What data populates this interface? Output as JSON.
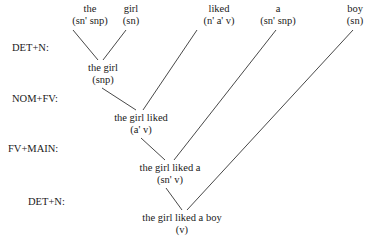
{
  "leaves": [
    {
      "word": "the",
      "category": "(sn' snp)",
      "x": 90,
      "y": 3
    },
    {
      "word": "girl",
      "category": "(sn)",
      "x": 131,
      "y": 3
    },
    {
      "word": "liked",
      "category": "(n' a' v)",
      "x": 219,
      "y": 3
    },
    {
      "word": "a",
      "category": "(sn' snp)",
      "x": 278,
      "y": 3
    },
    {
      "word": "boy",
      "category": "(sn)",
      "x": 355,
      "y": 3
    }
  ],
  "nodes": [
    {
      "phrase": "the girl",
      "category": "(snp)",
      "x": 103,
      "y": 62
    },
    {
      "phrase": "the girl liked",
      "category": "(a' v)",
      "x": 141,
      "y": 112
    },
    {
      "phrase": "the girl liked a",
      "category": "(sn' v)",
      "x": 170,
      "y": 162
    },
    {
      "phrase": "the girl liked a boy",
      "category": "(v)",
      "x": 182,
      "y": 212
    }
  ],
  "rules": [
    {
      "label": "DET+N:",
      "x": 12,
      "y": 42
    },
    {
      "label": "NOM+FV:",
      "x": 12,
      "y": 93
    },
    {
      "label": "FV+MAIN:",
      "x": 8,
      "y": 143
    },
    {
      "label": "DET+N:",
      "x": 28,
      "y": 196
    }
  ],
  "edges": [
    {
      "x1": 73,
      "y1": 30,
      "x2": 98,
      "y2": 60
    },
    {
      "x1": 126,
      "y1": 30,
      "x2": 103,
      "y2": 60
    },
    {
      "x1": 102,
      "y1": 88,
      "x2": 136,
      "y2": 110
    },
    {
      "x1": 197,
      "y1": 30,
      "x2": 143,
      "y2": 110
    },
    {
      "x1": 141,
      "y1": 138,
      "x2": 165,
      "y2": 160
    },
    {
      "x1": 276,
      "y1": 30,
      "x2": 174,
      "y2": 160
    },
    {
      "x1": 166,
      "y1": 188,
      "x2": 182,
      "y2": 210
    },
    {
      "x1": 353,
      "y1": 30,
      "x2": 187,
      "y2": 210
    }
  ]
}
